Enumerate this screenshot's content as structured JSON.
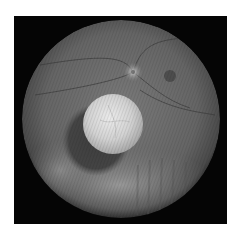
{
  "image": {
    "kind": "fundus-photograph",
    "mode": "grayscale",
    "background_color": "#ffffff",
    "frame_color": "#050505",
    "fundus": {
      "cx": 121,
      "cy": 119,
      "r": 99,
      "base_color": "#6a6a6a"
    },
    "optic_disc": {
      "cx": 133,
      "cy": 72,
      "r": 8
    },
    "macula": {
      "cx": 170,
      "cy": 76,
      "r": 6
    },
    "lesion": {
      "cx": 113,
      "cy": 124,
      "r": 30,
      "color": "#d8d8d8"
    },
    "lesion_shadow": {
      "cx": 97,
      "cy": 140,
      "rx": 32,
      "ry": 34
    }
  }
}
